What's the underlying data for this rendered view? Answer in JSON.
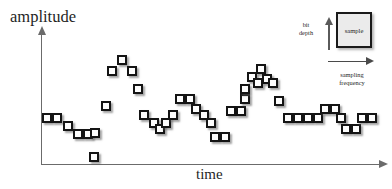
{
  "figure": {
    "title_visible": false,
    "background_color": "#ffffff"
  },
  "axes": {
    "y_label": "amplitude",
    "x_label": "time",
    "axis_color": "#6b6b6b",
    "y_arrow_icon": "up-arrow-icon",
    "x_arrow_icon": "right-arrow-icon"
  },
  "legend": {
    "bit_depth_label": "bit\ndepth",
    "sampling_frequency_label": "sampling\nfrequency",
    "sample_box_label": "sample",
    "sample_box_fill": "#ebebeb",
    "sample_box_border": "#1a1a1a",
    "bit_depth_arrow_icon": "up-arrow-icon",
    "sampling_frequency_arrow_icon": "right-arrow-icon"
  },
  "chart_data": {
    "type": "scatter",
    "title": "",
    "xlabel": "time",
    "ylabel": "amplitude",
    "grid": false,
    "legend_position": "top-right",
    "marker": "square",
    "marker_size_px": 10,
    "marker_fill": "#fdfdfd",
    "marker_border": "#141414",
    "xlim": [
      0,
      392
    ],
    "ylim": [
      0,
      189
    ],
    "note": "Digital audio sampling illustration: quantized samples drawn as squares; x = pixel left, y = pixel top of each square marker.",
    "samples": [
      {
        "x": 42,
        "y": 113
      },
      {
        "x": 52,
        "y": 113
      },
      {
        "x": 63,
        "y": 121
      },
      {
        "x": 73,
        "y": 129
      },
      {
        "x": 83,
        "y": 129
      },
      {
        "x": 89,
        "y": 152
      },
      {
        "x": 90,
        "y": 128
      },
      {
        "x": 101,
        "y": 101
      },
      {
        "x": 107,
        "y": 66
      },
      {
        "x": 117,
        "y": 55
      },
      {
        "x": 127,
        "y": 66
      },
      {
        "x": 133,
        "y": 84
      },
      {
        "x": 139,
        "y": 110
      },
      {
        "x": 149,
        "y": 118
      },
      {
        "x": 155,
        "y": 124
      },
      {
        "x": 161,
        "y": 118
      },
      {
        "x": 168,
        "y": 110
      },
      {
        "x": 175,
        "y": 94
      },
      {
        "x": 185,
        "y": 94
      },
      {
        "x": 191,
        "y": 104
      },
      {
        "x": 199,
        "y": 110
      },
      {
        "x": 206,
        "y": 118
      },
      {
        "x": 210,
        "y": 132
      },
      {
        "x": 220,
        "y": 132
      },
      {
        "x": 226,
        "y": 106
      },
      {
        "x": 236,
        "y": 106
      },
      {
        "x": 240,
        "y": 94
      },
      {
        "x": 240,
        "y": 84
      },
      {
        "x": 247,
        "y": 72
      },
      {
        "x": 253,
        "y": 78
      },
      {
        "x": 256,
        "y": 64
      },
      {
        "x": 262,
        "y": 74
      },
      {
        "x": 268,
        "y": 78
      },
      {
        "x": 274,
        "y": 96
      },
      {
        "x": 283,
        "y": 113
      },
      {
        "x": 293,
        "y": 113
      },
      {
        "x": 303,
        "y": 113
      },
      {
        "x": 313,
        "y": 113
      },
      {
        "x": 320,
        "y": 104
      },
      {
        "x": 330,
        "y": 104
      },
      {
        "x": 336,
        "y": 113
      },
      {
        "x": 341,
        "y": 124
      },
      {
        "x": 351,
        "y": 124
      },
      {
        "x": 357,
        "y": 113
      },
      {
        "x": 367,
        "y": 113
      }
    ]
  }
}
